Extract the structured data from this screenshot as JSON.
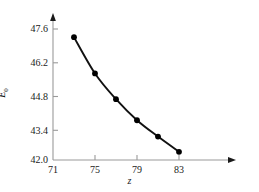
{
  "figure": {
    "name": "line-chart-E0-vs-z",
    "background_color": "#ffffff",
    "line_color": "#111111",
    "marker_color": "#000000",
    "axis_color": "#9a9a9a"
  },
  "chart_data": {
    "type": "line",
    "title": "",
    "subtitle": "",
    "xlabel": "z",
    "ylabel": "E0",
    "ylabel_base": "E",
    "ylabel_sub": "0",
    "x": [
      73,
      75,
      77,
      79,
      81,
      83
    ],
    "values": [
      47.25,
      45.7,
      44.6,
      43.7,
      43.0,
      42.35
    ],
    "series": [
      {
        "name": "E0",
        "x": [
          73,
          75,
          77,
          79,
          81,
          83
        ],
        "values": [
          47.25,
          45.7,
          44.6,
          43.7,
          43.0,
          42.35
        ]
      }
    ],
    "xlim": [
      71,
      83
    ],
    "ylim": [
      42.0,
      47.6
    ],
    "xticks": [
      71,
      75,
      79,
      83
    ],
    "yticks": [
      42.0,
      43.4,
      44.8,
      46.2,
      47.6
    ],
    "xticklabels": [
      "71",
      "75",
      "79",
      "83"
    ],
    "yticklabels": [
      "42.0",
      "43.4",
      "44.8",
      "46.2",
      "47.6"
    ],
    "grid": false,
    "legend": null,
    "legend_position": "none",
    "marker": "filled-circle",
    "annotations": []
  },
  "axes": {
    "y_tick_labels": [
      {
        "value": "47.6",
        "top": 24
      },
      {
        "value": "46.2",
        "top": 58
      },
      {
        "value": "44.8",
        "top": 92
      },
      {
        "value": "43.4",
        "top": 126
      },
      {
        "value": "42.0",
        "top": 156
      }
    ],
    "x_tick_labels": [
      {
        "value": "71",
        "left": 53
      },
      {
        "value": "75",
        "left": 95
      },
      {
        "value": "79",
        "left": 137
      },
      {
        "value": "83",
        "left": 179
      }
    ]
  }
}
